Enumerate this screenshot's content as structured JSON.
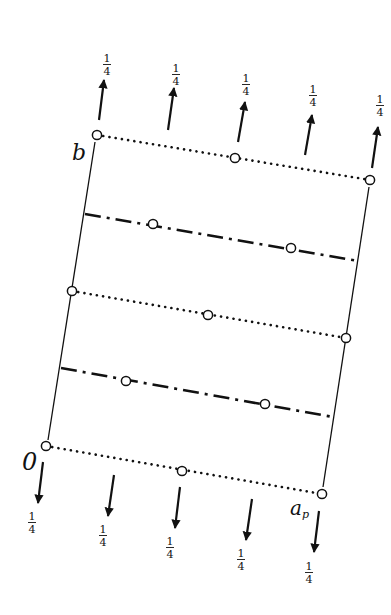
{
  "diagram": {
    "title": "",
    "colors": {
      "ink": "#111111",
      "background": "#ffffff"
    },
    "labels": {
      "origin": "0",
      "b_axis": "b",
      "a_axis": "a",
      "a_axis_sub": "p"
    },
    "fraction": {
      "numerator": "1",
      "denominator": "4"
    },
    "top_arrows": [
      {
        "x1": 99,
        "y1": 120,
        "x2": 104,
        "y2": 80,
        "label_x": 107,
        "label_y": 62
      },
      {
        "x1": 168,
        "y1": 130,
        "x2": 174,
        "y2": 88,
        "label_x": 176,
        "label_y": 72
      },
      {
        "x1": 238,
        "y1": 142,
        "x2": 245,
        "y2": 102,
        "label_x": 246,
        "label_y": 82
      },
      {
        "x1": 305,
        "y1": 155,
        "x2": 312,
        "y2": 115,
        "label_x": 313,
        "label_y": 93
      },
      {
        "x1": 372,
        "y1": 168,
        "x2": 378,
        "y2": 127,
        "label_x": 380,
        "label_y": 103
      }
    ],
    "bottom_arrows": [
      {
        "x1": 43,
        "y1": 462,
        "x2": 38,
        "y2": 503,
        "label_x": 32,
        "label_y": 520
      },
      {
        "x1": 114,
        "y1": 475,
        "x2": 108,
        "y2": 516,
        "label_x": 103,
        "label_y": 533
      },
      {
        "x1": 180,
        "y1": 487,
        "x2": 175,
        "y2": 528,
        "label_x": 170,
        "label_y": 545
      },
      {
        "x1": 252,
        "y1": 499,
        "x2": 246,
        "y2": 540,
        "label_x": 241,
        "label_y": 557
      },
      {
        "x1": 319,
        "y1": 511,
        "x2": 314,
        "y2": 552,
        "label_x": 309,
        "label_y": 570
      }
    ],
    "dotted_lines": [
      {
        "x1": 97,
        "y1": 135,
        "x2": 370,
        "y2": 180,
        "circles": [
          [
            97,
            135
          ],
          [
            235,
            158
          ],
          [
            370,
            180
          ]
        ]
      },
      {
        "x1": 72,
        "y1": 291,
        "x2": 346,
        "y2": 338,
        "circles": [
          [
            72,
            291
          ],
          [
            208,
            315
          ],
          [
            346,
            338
          ]
        ]
      },
      {
        "x1": 46,
        "y1": 446,
        "x2": 322,
        "y2": 494,
        "circles": [
          [
            46,
            446
          ],
          [
            182,
            471
          ],
          [
            322,
            494
          ]
        ]
      }
    ],
    "dashdot_lines": [
      {
        "x1": 85,
        "y1": 214,
        "x2": 358,
        "y2": 261,
        "circles": [
          [
            153,
            224
          ],
          [
            291,
            248
          ]
        ]
      },
      {
        "x1": 61,
        "y1": 368,
        "x2": 333,
        "y2": 417,
        "circles": [
          [
            126,
            381
          ],
          [
            265,
            404
          ]
        ]
      }
    ],
    "cell_edges": [
      {
        "x1": 95,
        "y1": 142,
        "x2": 48,
        "y2": 440
      },
      {
        "x1": 369,
        "y1": 187,
        "x2": 323,
        "y2": 487
      }
    ]
  }
}
